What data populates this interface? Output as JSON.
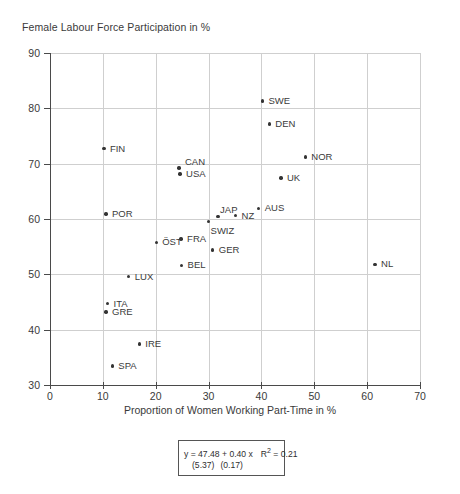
{
  "chart_data": {
    "type": "scatter",
    "title": "",
    "ylabel": "Female Labour Force Participation in %",
    "xlabel": "Proportion of Women Working Part-Time in %",
    "xlim": [
      0,
      70
    ],
    "ylim": [
      30,
      90
    ],
    "xticks": [
      0,
      10,
      20,
      30,
      40,
      50,
      60,
      70
    ],
    "yticks": [
      30,
      40,
      50,
      60,
      70,
      80,
      90
    ],
    "grid": true,
    "legend": "none",
    "marker_color": "#333333",
    "points": [
      {
        "label": "SWE",
        "x": 40.2,
        "y": 81.3,
        "lx": 6,
        "ly": -5
      },
      {
        "label": "DEN",
        "x": 41.5,
        "y": 77.2,
        "lx": 6,
        "ly": -5
      },
      {
        "label": "FIN",
        "x": 10.2,
        "y": 72.7,
        "lx": 6,
        "ly": -5
      },
      {
        "label": "NOR",
        "x": 48.3,
        "y": 71.2,
        "lx": 6,
        "ly": -5
      },
      {
        "label": "CAN",
        "x": 24.4,
        "y": 69.2,
        "lx": 6,
        "ly": -11
      },
      {
        "label": "USA",
        "x": 24.6,
        "y": 68.1,
        "lx": 6,
        "ly": -5
      },
      {
        "label": "UK",
        "x": 43.7,
        "y": 67.4,
        "lx": 6,
        "ly": -5
      },
      {
        "label": "AUS",
        "x": 39.5,
        "y": 61.9,
        "lx": 6,
        "ly": -5
      },
      {
        "label": "POR",
        "x": 10.6,
        "y": 60.9,
        "lx": 6,
        "ly": -5
      },
      {
        "label": "NZ",
        "x": 35.1,
        "y": 60.6,
        "lx": 6,
        "ly": -5
      },
      {
        "label": "JAP",
        "x": 31.8,
        "y": 60.4,
        "lx": 2,
        "ly": -12
      },
      {
        "label": "SWIZ",
        "x": 30.0,
        "y": 59.5,
        "lx": 2,
        "ly": 4
      },
      {
        "label": "FRA",
        "x": 24.8,
        "y": 56.4,
        "lx": 6,
        "ly": -5
      },
      {
        "label": "ÖST",
        "x": 20.1,
        "y": 55.8,
        "lx": 6,
        "ly": -5
      },
      {
        "label": "GER",
        "x": 30.8,
        "y": 54.4,
        "lx": 6,
        "ly": -5
      },
      {
        "label": "BEL",
        "x": 24.9,
        "y": 51.6,
        "lx": 6,
        "ly": -5
      },
      {
        "label": "NL",
        "x": 61.5,
        "y": 51.8,
        "lx": 6,
        "ly": -5
      },
      {
        "label": "LUX",
        "x": 14.9,
        "y": 49.6,
        "lx": 6,
        "ly": -5
      },
      {
        "label": "ITA",
        "x": 10.9,
        "y": 44.7,
        "lx": 6,
        "ly": -5
      },
      {
        "label": "GRE",
        "x": 10.6,
        "y": 43.2,
        "lx": 6,
        "ly": -5
      },
      {
        "label": "IRE",
        "x": 16.9,
        "y": 37.4,
        "lx": 6,
        "ly": -5
      },
      {
        "label": "SPA",
        "x": 11.8,
        "y": 33.4,
        "lx": 6,
        "ly": -5
      }
    ],
    "annotation": {
      "equation_y": "y = 47.48 + 0.40 x",
      "r_squared_label": "R",
      "r_squared_sup": "2",
      "r_squared_value": "= 0.21",
      "se_intercept": "(5.37)",
      "se_slope": "(0.17)"
    }
  }
}
